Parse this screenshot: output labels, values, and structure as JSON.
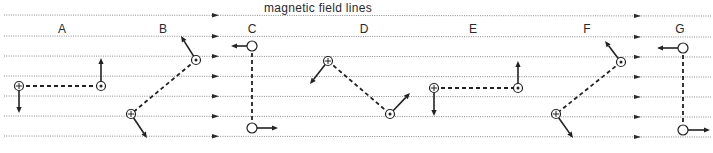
{
  "title": "magnetic field lines",
  "colors": {
    "ink": "#222222",
    "field_line": "#8a8a8a",
    "background": "#ffffff"
  },
  "field_lines": {
    "count": 7,
    "y_positions": [
      15,
      36,
      56,
      76,
      96,
      116,
      136
    ],
    "arrow_x_positions": [
      215,
      637
    ],
    "direction": "right"
  },
  "symbols_legend": {
    "circle-plus": "into page",
    "circle-dot": "out of page",
    "open-circle": "in plane"
  },
  "configurations": [
    {
      "label": "A",
      "label_x": 62,
      "nodes": [
        {
          "x": 19,
          "y": 86,
          "symbol": "circle-plus",
          "vector_to": [
            19,
            113
          ]
        },
        {
          "x": 101,
          "y": 86,
          "symbol": "circle-dot",
          "vector_to": [
            101,
            58
          ]
        }
      ]
    },
    {
      "label": "B",
      "label_x": 163,
      "nodes": [
        {
          "x": 196,
          "y": 60,
          "symbol": "circle-dot",
          "vector_to": [
            181,
            36
          ]
        },
        {
          "x": 131,
          "y": 114,
          "symbol": "circle-plus",
          "vector_to": [
            147,
            138
          ]
        }
      ]
    },
    {
      "label": "C",
      "label_x": 252,
      "nodes": [
        {
          "x": 252,
          "y": 46,
          "symbol": "open-circle",
          "vector_to": [
            231,
            46
          ]
        },
        {
          "x": 252,
          "y": 128,
          "symbol": "open-circle",
          "vector_to": [
            278,
            128
          ]
        }
      ]
    },
    {
      "label": "D",
      "label_x": 364,
      "nodes": [
        {
          "x": 328,
          "y": 61,
          "symbol": "circle-plus",
          "vector_to": [
            310,
            84
          ]
        },
        {
          "x": 390,
          "y": 114,
          "symbol": "circle-dot",
          "vector_to": [
            410,
            93
          ]
        }
      ]
    },
    {
      "label": "E",
      "label_x": 473,
      "nodes": [
        {
          "x": 434,
          "y": 88,
          "symbol": "circle-plus",
          "vector_to": [
            434,
            116
          ]
        },
        {
          "x": 518,
          "y": 88,
          "symbol": "circle-dot",
          "vector_to": [
            518,
            61
          ]
        }
      ]
    },
    {
      "label": "F",
      "label_x": 587,
      "nodes": [
        {
          "x": 621,
          "y": 62,
          "symbol": "circle-dot",
          "vector_to": [
            605,
            41
          ]
        },
        {
          "x": 556,
          "y": 114,
          "symbol": "circle-plus",
          "vector_to": [
            573,
            138
          ]
        }
      ]
    },
    {
      "label": "G",
      "label_x": 680,
      "nodes": [
        {
          "x": 683,
          "y": 48,
          "symbol": "open-circle",
          "vector_to": [
            657,
            48
          ]
        },
        {
          "x": 683,
          "y": 130,
          "symbol": "open-circle",
          "vector_to": [
            710,
            130
          ]
        }
      ]
    }
  ]
}
